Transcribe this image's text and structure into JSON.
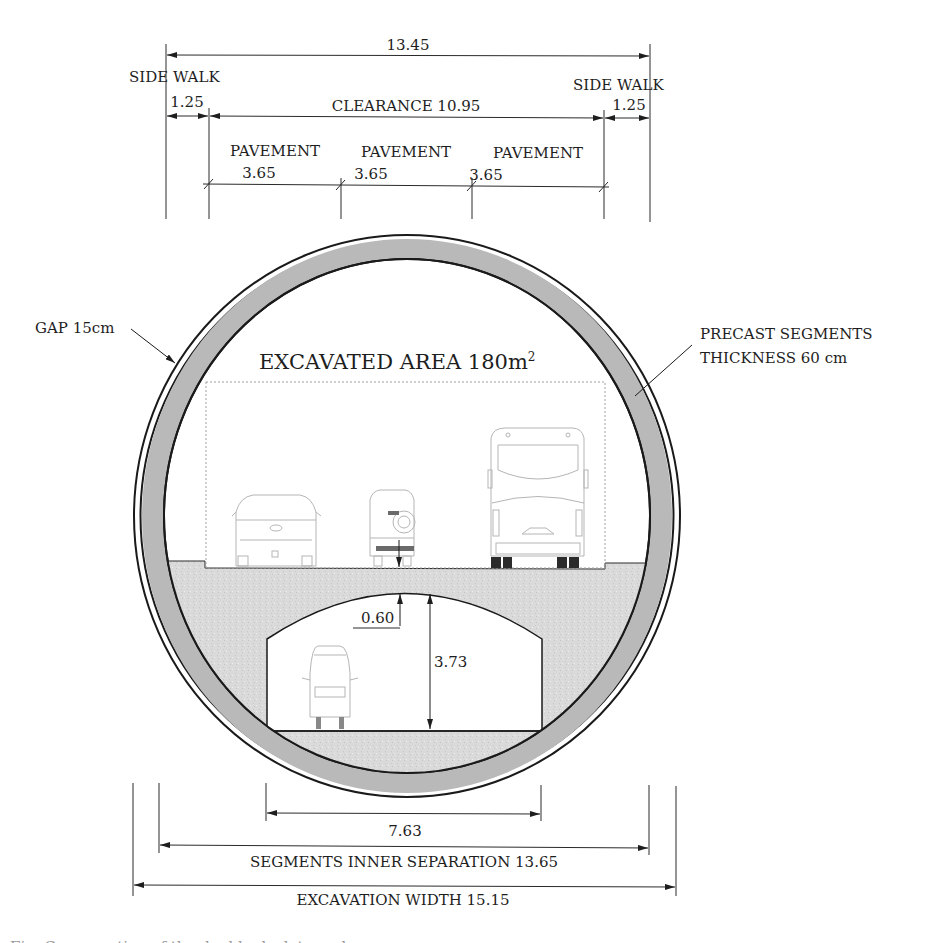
{
  "figure": {
    "title": "EXCAVATED AREA 180m",
    "title_superscript": "2",
    "colors": {
      "segment_fill": "#b9b9b9",
      "fill_concrete": "#dcdcdc",
      "line": "#1a1a1a",
      "vehicle_line": "#b5b5b5"
    }
  },
  "top_dimensions": {
    "overall": "13.45",
    "sidewalk_left_label": "SIDE WALK",
    "sidewalk_left_value": "1.25",
    "sidewalk_right_label": "SIDE WALK",
    "sidewalk_right_value": "1.25",
    "clearance": "CLEARANCE 10.95",
    "pavements": [
      {
        "label": "PAVEMENT",
        "value": "3.65"
      },
      {
        "label": "PAVEMENT",
        "value": "3.65"
      },
      {
        "label": "PAVEMENT",
        "value": "3.65"
      }
    ]
  },
  "annotations": {
    "gap": "GAP 15cm",
    "precast_line1": "PRECAST SEGMENTS",
    "precast_line2": "THICKNESS 60 cm",
    "slab_thickness": "0.60",
    "lower_height": "3.73"
  },
  "bottom_dimensions": {
    "lower_width": "7.63",
    "inner_separation": "SEGMENTS INNER SEPARATION 13.65",
    "excavation_width": "EXCAVATION WIDTH 15.15"
  },
  "vehicles": {
    "upper_deck": [
      "pickup-truck",
      "suv",
      "bus"
    ],
    "lower_deck": [
      "car"
    ]
  },
  "caption_clipped": "Fig. Cross section of the double-deck tunnel"
}
